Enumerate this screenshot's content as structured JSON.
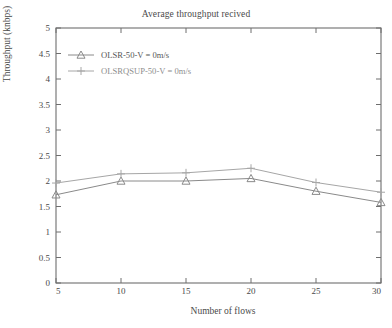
{
  "chart_data": {
    "type": "line",
    "title": "Average throughput recived",
    "xlabel": "Number of flows",
    "ylabel": "Throughput (knbps)",
    "x": [
      5,
      10,
      15,
      20,
      25,
      30
    ],
    "xtick_labels": [
      "5",
      "10",
      "15",
      "20",
      "25",
      "30"
    ],
    "ytick_labels": [
      "0",
      "0.5",
      "1",
      "1.5",
      "2",
      "2.5",
      "3",
      "3.5",
      "4",
      "4.5",
      "5"
    ],
    "ytick_values": [
      0,
      0.5,
      1,
      1.5,
      2,
      2.5,
      3,
      3.5,
      4,
      4.5,
      5
    ],
    "xlim": [
      5,
      30
    ],
    "ylim": [
      0,
      5
    ],
    "grid": false,
    "legend_position": "upper-left",
    "series": [
      {
        "name": "OLSR-50-V = 0m/s",
        "marker": "triangle",
        "color": "#8a8a8a",
        "values": [
          1.73,
          2.0,
          2.0,
          2.05,
          1.8,
          1.58
        ]
      },
      {
        "name": "OLSRQSUP-50-V = 0m/s",
        "marker": "plus",
        "color": "#a6a6a6",
        "values": [
          1.96,
          2.14,
          2.16,
          2.25,
          1.97,
          1.78
        ]
      }
    ]
  },
  "axis": {
    "frame_color": "#6e6e6e"
  }
}
